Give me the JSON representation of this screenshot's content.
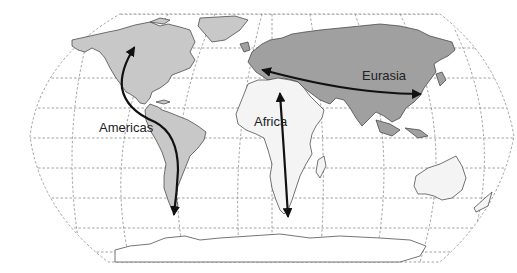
{
  "map": {
    "projection": "world-robinson",
    "colors": {
      "americas": "#c8c8c8",
      "eurasia": "#a0a0a0",
      "africa": "#f4f4f4",
      "australia": "#f4f4f4",
      "antarctica": "#ffffff",
      "graticule": "#8a8a8a",
      "arrow": "#111111"
    },
    "labels": {
      "americas": "Americas",
      "africa": "Africa",
      "eurasia": "Eurasia"
    },
    "arrows": [
      {
        "name": "americas-axis",
        "orientation": "north-south",
        "heads": "both"
      },
      {
        "name": "africa-axis",
        "orientation": "north-south",
        "heads": "both"
      },
      {
        "name": "eurasia-axis",
        "orientation": "east-west",
        "heads": "both"
      }
    ]
  }
}
